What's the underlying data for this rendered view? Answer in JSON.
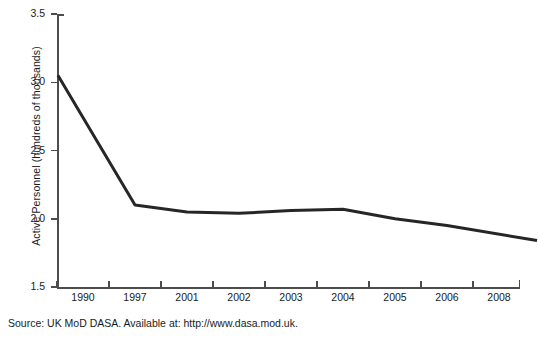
{
  "chart_data": {
    "type": "line",
    "title": "",
    "subtitle": "",
    "xlabel": "",
    "ylabel": "Active Personnel (hundreds of thousands)",
    "categories": [
      "1990",
      "1997",
      "2001",
      "2002",
      "2003",
      "2004",
      "2005",
      "2006",
      "2008"
    ],
    "x": [
      1990,
      1997,
      2001,
      2002,
      2003,
      2004,
      2005,
      2006,
      2008
    ],
    "values": [
      3.05,
      2.1,
      2.05,
      2.04,
      2.06,
      2.07,
      2.0,
      1.95,
      1.84
    ],
    "series": [
      {
        "name": "Active Personnel",
        "values": [
          3.05,
          2.1,
          2.05,
          2.04,
          2.06,
          2.07,
          2.0,
          1.95,
          1.84
        ]
      }
    ],
    "ylim": [
      1.5,
      3.5
    ],
    "ytick_labels": [
      "3.5",
      "3.0",
      "2.5",
      "2.0",
      "1.5"
    ],
    "ytick_values": [
      3.5,
      3.0,
      2.5,
      2.0,
      1.5
    ],
    "grid": false,
    "legend": false,
    "legend_position": "none",
    "line_color": "#262626",
    "axis_color": "#4d4d4d",
    "background_color": "#ffffff",
    "annotations": []
  },
  "axes": {
    "y_title": "Active Personnel (hundreds of thousands)",
    "y_ticks": [
      {
        "label": "3.5",
        "value": 3.5
      },
      {
        "label": "3.0",
        "value": 3.0
      },
      {
        "label": "2.5",
        "value": 2.5
      },
      {
        "label": "2.0",
        "value": 2.0
      },
      {
        "label": "1.5",
        "value": 1.5
      }
    ],
    "x_ticks": [
      {
        "label": "1990"
      },
      {
        "label": "1997"
      },
      {
        "label": "2001"
      },
      {
        "label": "2002"
      },
      {
        "label": "2003"
      },
      {
        "label": "2004"
      },
      {
        "label": "2005"
      },
      {
        "label": "2006"
      },
      {
        "label": "2008"
      }
    ]
  },
  "footer": {
    "source": "Source: UK MoD DASA. Available at: http://www.dasa.mod.uk."
  }
}
